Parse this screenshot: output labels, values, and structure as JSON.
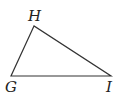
{
  "diagram": {
    "type": "triangle",
    "stroke_color": "#333333",
    "vertices": [
      {
        "name": "H",
        "x": 34,
        "y": 26,
        "label_x": 28,
        "label_y": 21
      },
      {
        "name": "G",
        "x": 11,
        "y": 76,
        "label_x": 5,
        "label_y": 92
      },
      {
        "name": "I",
        "x": 111,
        "y": 76,
        "label_x": 106,
        "label_y": 92
      }
    ],
    "labels": {
      "H": "H",
      "G": "G",
      "I": "I"
    }
  }
}
